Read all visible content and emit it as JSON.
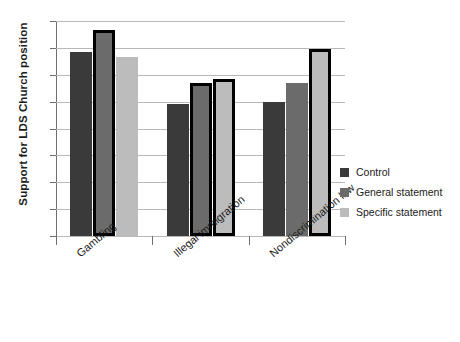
{
  "chart_data": {
    "type": "bar",
    "title": "",
    "xlabel": "",
    "ylabel": "Support for LDS Church position",
    "ylim": [
      0,
      80
    ],
    "ytick_step": 10,
    "yticks": [
      0,
      10,
      20,
      30,
      40,
      50,
      60,
      70,
      80
    ],
    "grid": true,
    "legend_position": "right",
    "categories": [
      "Gambling",
      "Illegal immigration",
      "Nondiscrimination law"
    ],
    "series": [
      {
        "name": "Control",
        "color": "#3a3a3a",
        "values": [
          68.5,
          49.0,
          50.0
        ]
      },
      {
        "name": "General statement",
        "color": "#6b6b6b",
        "values": [
          76.5,
          57.0,
          57.0
        ]
      },
      {
        "name": "Specific statement",
        "color": "#bcbcbc",
        "values": [
          66.5,
          58.5,
          69.5
        ]
      }
    ],
    "outlined_bars": [
      {
        "category": "Gambling",
        "series": "General statement"
      },
      {
        "category": "Illegal immigration",
        "series": "General statement"
      },
      {
        "category": "Illegal immigration",
        "series": "Specific statement"
      },
      {
        "category": "Nondiscrimination law",
        "series": "Specific statement"
      }
    ]
  },
  "colors": {
    "control": "#3a3a3a",
    "general": "#6b6b6b",
    "specific": "#bcbcbc",
    "gridline": "#b9b9b9",
    "axis": "#6e6e6e",
    "outline": "#000000",
    "text": "#1a1a1a",
    "background": "#ffffff"
  },
  "legend": {
    "items": [
      {
        "label": "Control"
      },
      {
        "label": "General statement"
      },
      {
        "label": "Specific statement"
      }
    ]
  }
}
